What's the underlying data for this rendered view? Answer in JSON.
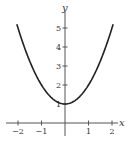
{
  "chart_data": {
    "type": "line",
    "title": "",
    "xlabel": "x",
    "ylabel": "y",
    "function": "y = x^2 + 1",
    "xlim": [
      -2.1,
      2.2
    ],
    "ylim": [
      0,
      5.5
    ],
    "grid": false,
    "legend": null,
    "x_ticks": [
      -2,
      -1,
      1,
      2
    ],
    "x_tick_labels": [
      "−2",
      "−1",
      "1",
      "2"
    ],
    "y_ticks": [
      1,
      2,
      3,
      4,
      5
    ],
    "y_tick_labels": [
      "1",
      "2",
      "3",
      "4",
      "5"
    ],
    "series": [
      {
        "name": "y = x^2 + 1",
        "color": "#222222",
        "x": [
          -2.05,
          -2.0,
          -1.5,
          -1.0,
          -0.5,
          0.0,
          0.5,
          1.0,
          1.5,
          2.0,
          2.05
        ],
        "y": [
          5.2,
          5.0,
          3.25,
          2.0,
          1.25,
          1.0,
          1.25,
          2.0,
          3.25,
          5.0,
          5.2
        ]
      }
    ]
  },
  "layout": {
    "origin_px": [
      65,
      123
    ],
    "x_px_per_unit": 23.5,
    "y_px_per_unit": 19,
    "axis_color": "#555555",
    "curve_color": "#222222"
  }
}
